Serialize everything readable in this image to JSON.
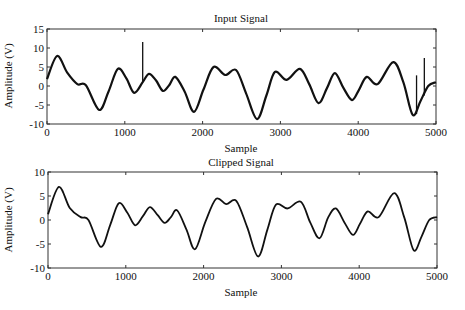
{
  "chart_data": [
    {
      "type": "line",
      "title": "Input Signal",
      "xlabel": "Sample",
      "ylabel": "Amplitude (V)",
      "xlim": [
        0,
        5000
      ],
      "ylim": [
        -10,
        15
      ],
      "xticks": [
        0,
        1000,
        2000,
        3000,
        4000,
        5000
      ],
      "yticks": [
        -10,
        -5,
        0,
        5,
        10,
        15
      ],
      "grid": false,
      "series": [
        {
          "name": "input",
          "x": [
            0,
            130,
            260,
            390,
            500,
            670,
            790,
            910,
            1020,
            1120,
            1230,
            1310,
            1400,
            1490,
            1570,
            1650,
            1770,
            1890,
            2010,
            2140,
            2290,
            2430,
            2560,
            2700,
            2820,
            2930,
            3080,
            3250,
            3370,
            3490,
            3600,
            3700,
            3810,
            3920,
            4010,
            4110,
            4250,
            4450,
            4580,
            4700,
            4800,
            4900,
            5000
          ],
          "y": [
            1.8,
            7.9,
            3.5,
            0.5,
            0.2,
            -6.3,
            -1.5,
            4.5,
            2.0,
            -1.8,
            1.0,
            3.2,
            1.5,
            -1.3,
            0.2,
            2.4,
            -1.5,
            -6.8,
            -1.0,
            5.0,
            2.9,
            4.2,
            -2.0,
            -8.7,
            -2.5,
            3.7,
            1.6,
            4.5,
            0.5,
            -4.5,
            -0.5,
            3.4,
            -0.5,
            -3.7,
            -1.0,
            2.4,
            0.5,
            6.3,
            1.0,
            -7.6,
            -4.0,
            0.0,
            1.0
          ]
        }
      ],
      "spikes": [
        {
          "x": 1230,
          "from": 1.0,
          "to": 11.6
        },
        {
          "x": 4750,
          "from": -7.4,
          "to": 2.8
        },
        {
          "x": 4850,
          "from": -2.5,
          "to": 7.4
        }
      ]
    },
    {
      "type": "line",
      "title": "Clipped Signal",
      "xlabel": "Sample",
      "ylabel": "Amplitude (V)",
      "xlim": [
        0,
        5000
      ],
      "ylim": [
        -10,
        10
      ],
      "xticks": [
        0,
        1000,
        2000,
        3000,
        4000,
        5000
      ],
      "yticks": [
        -10,
        -5,
        0,
        5,
        10
      ],
      "grid": false,
      "series": [
        {
          "name": "clipped",
          "x": [
            0,
            140,
            280,
            420,
            520,
            680,
            800,
            910,
            1020,
            1120,
            1220,
            1310,
            1410,
            1500,
            1580,
            1660,
            1780,
            1890,
            2020,
            2160,
            2290,
            2420,
            2560,
            2700,
            2820,
            2930,
            3080,
            3250,
            3370,
            3490,
            3600,
            3700,
            3810,
            3920,
            4010,
            4110,
            4250,
            4450,
            4580,
            4700,
            4800,
            4900,
            5000
          ],
          "y": [
            1.2,
            6.9,
            2.5,
            0.6,
            0.0,
            -5.6,
            -1.0,
            3.5,
            1.5,
            -1.1,
            0.8,
            2.7,
            1.0,
            -0.6,
            0.6,
            2.0,
            -2.0,
            -6.1,
            -0.5,
            4.4,
            3.3,
            4.0,
            -1.5,
            -7.6,
            -2.0,
            3.2,
            2.4,
            3.8,
            -0.5,
            -3.8,
            0.5,
            2.4,
            -0.5,
            -3.1,
            -0.8,
            1.8,
            0.6,
            5.6,
            0.5,
            -6.3,
            -3.5,
            0.0,
            0.6
          ]
        }
      ]
    }
  ]
}
